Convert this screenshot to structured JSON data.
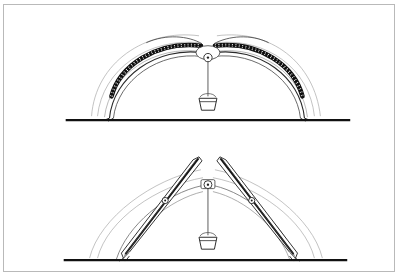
{
  "document": {
    "title": "Arch deformation diagram plate",
    "figure_count": 2,
    "background_color": "#ffffff",
    "border_color": "#b9b9b9",
    "ink_color": "#1a1a1a",
    "faint_ink_color": "#9a9a9a"
  },
  "figures": [
    {
      "id": "figure-top",
      "label": "Upper figure: flattened chain arch with hanging load",
      "caption": "",
      "ground": {
        "label": "ground line",
        "y": 116,
        "x_start": 62,
        "x_end": 348,
        "thickness": 2.4,
        "color": "#111111"
      },
      "arch": {
        "type": "chain-arch",
        "apex_x": 205,
        "apex_y": 44,
        "span_left_x": 96,
        "span_right_x": 312,
        "description": "two beaded chain arms curving up from the ground meeting near the crown with a small gap"
      },
      "chain": {
        "label": "chain band",
        "bead_count_per_arm": 26,
        "color": "#151515"
      },
      "outline_arcs": {
        "label": "faint guide arcs",
        "count": 3,
        "color": "#a5a5a5"
      },
      "pulley": {
        "label": "crown ring",
        "cx": 205,
        "cy": 53,
        "r": 4.2
      },
      "cord": {
        "label": "suspension cord",
        "x": 205,
        "y_top": 57,
        "y_bottom": 92
      },
      "load": {
        "label": "hanging bucket weight",
        "cx": 205,
        "top_y": 92,
        "width_top": 18,
        "width_bottom": 13,
        "height": 13
      }
    },
    {
      "id": "figure-bottom",
      "label": "Lower figure: peaked twin-beam arch with hanging load",
      "caption": "",
      "ground": {
        "label": "ground line",
        "y": 257,
        "x_start": 60,
        "x_end": 345,
        "thickness": 2.4,
        "color": "#111111"
      },
      "beams": {
        "label": "tapered rafter beams",
        "count": 2,
        "apex_gap_px": 14,
        "left_tip_x": 196,
        "right_tip_x": 217,
        "tip_y": 153,
        "color": "#1a1a1a"
      },
      "eyelets": {
        "label": "beam pivot eyelets",
        "count": 2,
        "positions": [
          {
            "cx": 162,
            "cy": 197,
            "r": 3.0
          },
          {
            "cx": 249,
            "cy": 197,
            "r": 3.0
          }
        ]
      },
      "inner_arch": {
        "label": "inner deformed arch",
        "apex_x": 205,
        "apex_y": 180,
        "color": "#4a4a4a"
      },
      "outline_arcs": {
        "label": "faint guide arcs",
        "count": 3,
        "color": "#a5a5a5"
      },
      "pulley": {
        "label": "crown ring",
        "cx": 205,
        "cy": 181,
        "r": 4.0
      },
      "cord": {
        "label": "suspension cord",
        "x": 205,
        "y_top": 185,
        "y_bottom": 232
      },
      "load": {
        "label": "hanging bucket weight",
        "cx": 205,
        "top_y": 232,
        "width_top": 18,
        "width_bottom": 13,
        "height": 13
      }
    }
  ]
}
